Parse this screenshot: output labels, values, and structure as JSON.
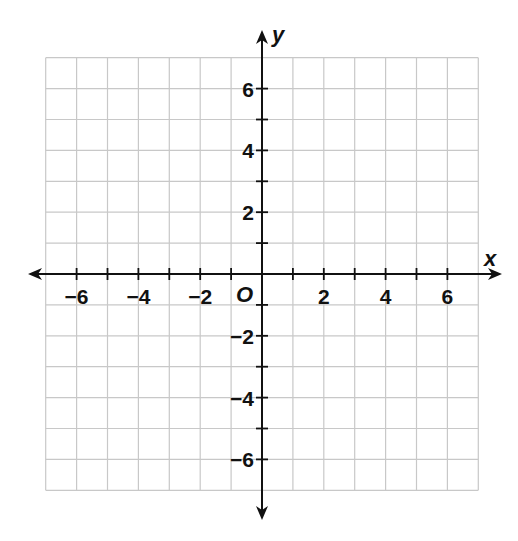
{
  "chart_data": {
    "type": "scatter",
    "title": "",
    "xlabel": "x",
    "ylabel": "y",
    "origin_label": "O",
    "xlim": [
      -7,
      7
    ],
    "ylim": [
      -7,
      7
    ],
    "grid": true,
    "grid_step": 1,
    "x_ticks": [
      -6,
      -4,
      -2,
      2,
      4,
      6
    ],
    "y_ticks": [
      6,
      4,
      2,
      -2,
      -4,
      -6
    ],
    "x_tick_labels": [
      "−6",
      "−4",
      "−2",
      "2",
      "4",
      "6"
    ],
    "y_tick_labels": [
      "6",
      "4",
      "2",
      "−2",
      "−4",
      "−6"
    ],
    "series": [],
    "colors": {
      "grid": "#c8c8c8",
      "axis": "#111111",
      "background": "#ffffff"
    }
  }
}
